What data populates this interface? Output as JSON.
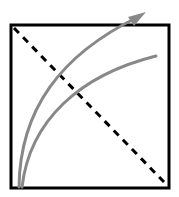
{
  "diagram": {
    "box": {
      "x": 11,
      "y": 25,
      "width": 158,
      "height": 163,
      "stroke": "#000000",
      "stroke_width": 3
    },
    "diagonal": {
      "x1": 14,
      "y1": 28,
      "x2": 164,
      "y2": 182,
      "stroke": "#000000",
      "dash": "7,6",
      "stroke_width": 3
    },
    "curves": [
      {
        "name": "upper-curve",
        "path": "M19,187 C20,110 60,55 138,17",
        "stroke": "#888888",
        "stroke_width": 3,
        "arrow": true
      },
      {
        "name": "lower-curve",
        "path": "M22,187 C30,120 80,75 156,56",
        "stroke": "#888888",
        "stroke_width": 3,
        "arrow": false
      }
    ],
    "arrowhead": {
      "points": "146,12 128,17 134,26",
      "fill": "#888888"
    }
  }
}
